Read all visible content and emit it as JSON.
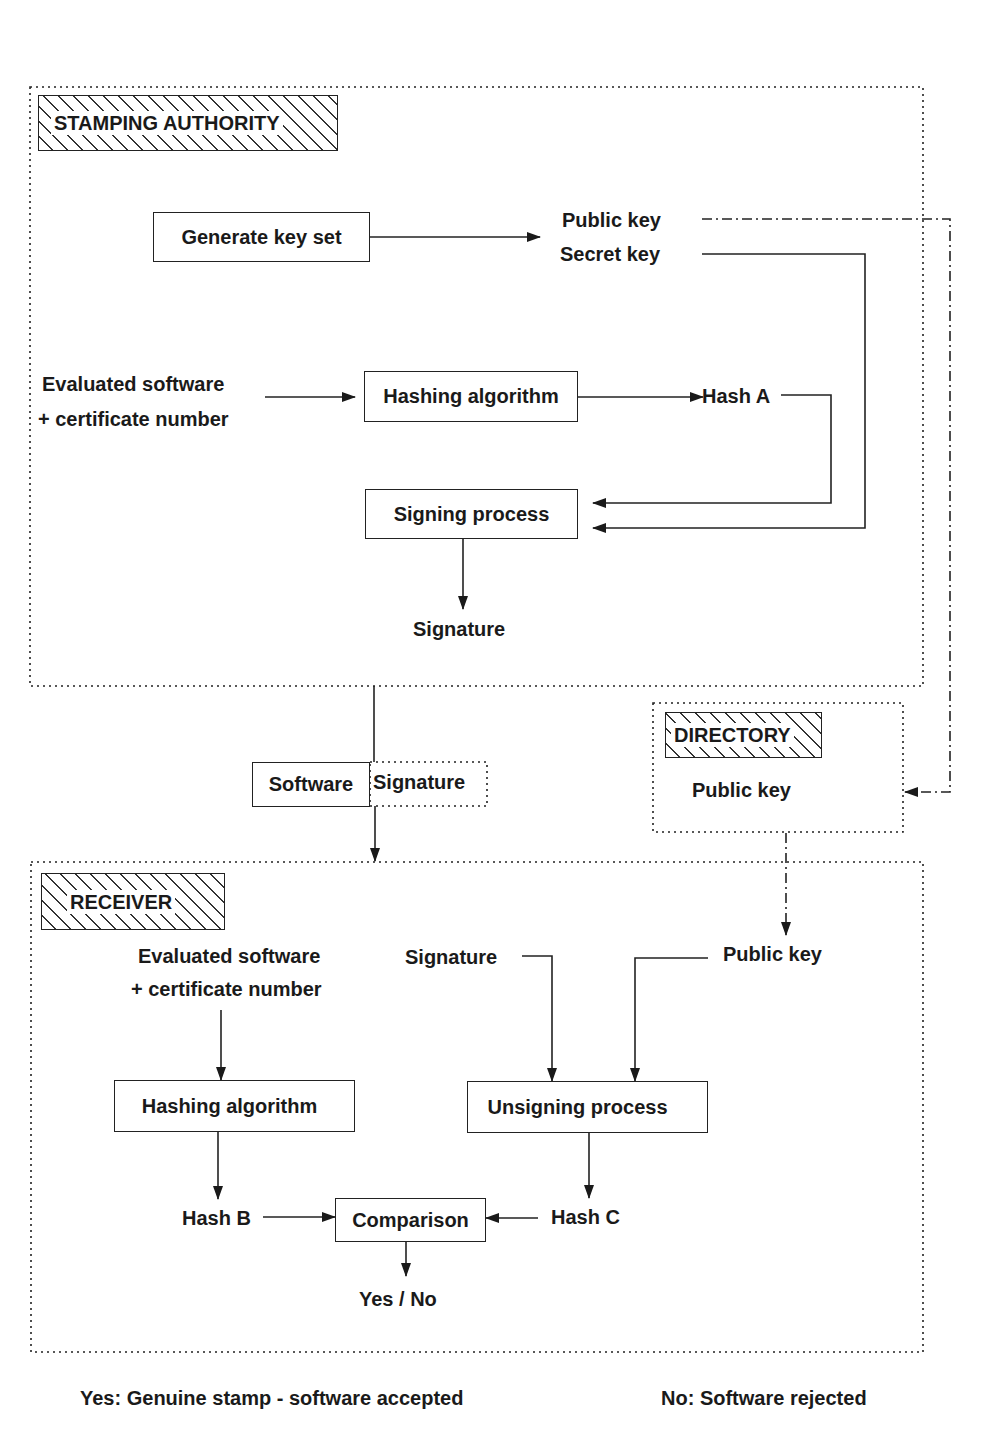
{
  "stamping_authority": {
    "title": "STAMPING AUTHORITY",
    "generate_key_set": "Generate key set",
    "public_key": "Public key",
    "secret_key": "Secret key",
    "evaluated_software_line1": "Evaluated software",
    "evaluated_software_line2": "+ certificate number",
    "hashing_algorithm": "Hashing algorithm",
    "hash_a": "Hash A",
    "signing_process": "Signing process",
    "signature": "Signature"
  },
  "transfer": {
    "software": "Software",
    "signature": "Signature"
  },
  "directory": {
    "title": "DIRECTORY",
    "public_key": "Public key"
  },
  "receiver": {
    "title": "RECEIVER",
    "evaluated_software_line1": "Evaluated software",
    "evaluated_software_line2": "+ certificate number",
    "signature": "Signature",
    "public_key": "Public key",
    "hashing_algorithm": "Hashing algorithm",
    "unsigning_process": "Unsigning process",
    "hash_b": "Hash B",
    "hash_c": "Hash C",
    "comparison": "Comparison",
    "result": "Yes / No"
  },
  "legend": {
    "yes": "Yes: Genuine stamp - software accepted",
    "no": "No: Software rejected"
  }
}
